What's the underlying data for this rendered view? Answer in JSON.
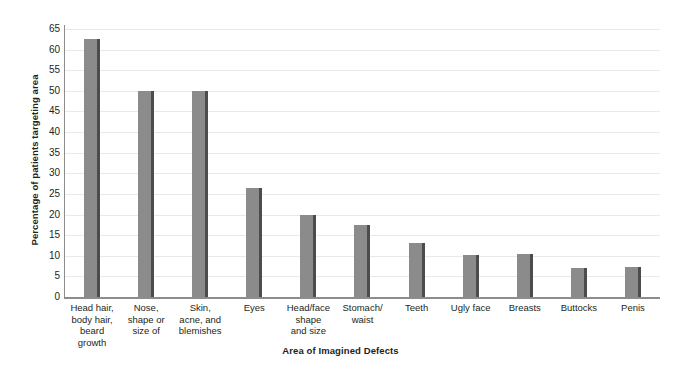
{
  "chart_data": {
    "type": "bar",
    "title": "",
    "xlabel": "Area of Imagined Defects",
    "ylabel": "Percentage of patients targeting area",
    "ylim": [
      0,
      65
    ],
    "yticks": [
      0,
      5,
      10,
      15,
      20,
      25,
      30,
      35,
      40,
      45,
      50,
      55,
      60,
      65
    ],
    "grid": true,
    "legend": "none",
    "bar_color": "#8b8b8b",
    "bar_shadow_color": "#4c4c4c",
    "gridline_color": "#e9e9e9",
    "axis_color": "#8d8d8d",
    "background": "#ffffff",
    "categories": [
      "Head hair, body hair, beard growth",
      "Nose, shape or size of",
      "Skin, acne, and blemishes",
      "Eyes",
      "Head/face shape and size",
      "Stomach/ waist",
      "Teeth",
      "Ugly face",
      "Breasts",
      "Buttocks",
      "Penis"
    ],
    "category_lines": [
      [
        "Head hair,",
        "body hair,",
        "beard",
        "growth"
      ],
      [
        "Nose,",
        "shape or",
        "size of"
      ],
      [
        "Skin,",
        "acne, and",
        "blemishes"
      ],
      [
        "Eyes"
      ],
      [
        "Head/face",
        "shape",
        "and size"
      ],
      [
        "Stomach/",
        "waist"
      ],
      [
        "Teeth"
      ],
      [
        "Ugly face"
      ],
      [
        "Breasts"
      ],
      [
        "Buttocks"
      ],
      [
        "Penis"
      ]
    ],
    "values": [
      62.5,
      50,
      50,
      26.5,
      20,
      17.5,
      13,
      10.3,
      10.5,
      7,
      7.3
    ]
  }
}
